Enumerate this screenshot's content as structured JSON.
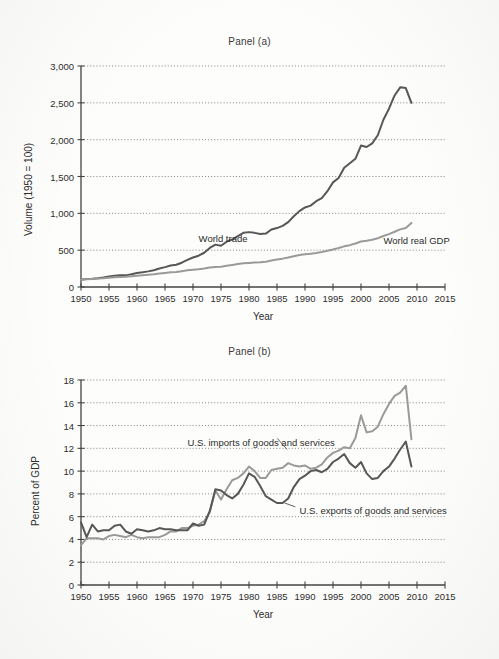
{
  "figure": {
    "background_color": "#fdfdfb",
    "dark_line_color": "#575757",
    "light_line_color": "#9a9a9a",
    "axis_color": "#444444",
    "grid_color": "#777777"
  },
  "chart_data": [
    {
      "type": "line",
      "title": "Panel (a)",
      "xlabel": "Year",
      "ylabel": "Volume (1950 = 100)",
      "xlim": [
        1950,
        2015
      ],
      "ylim": [
        0,
        3000
      ],
      "xticks": [
        1950,
        1955,
        1960,
        1965,
        1970,
        1975,
        1980,
        1985,
        1990,
        1995,
        2000,
        2005,
        2010,
        2015
      ],
      "xticklabels": [
        "1950",
        "1955",
        "1960",
        "1965",
        "1970",
        "1975",
        "1980",
        "1985",
        "1990",
        "1995",
        "2000",
        "2005",
        "2010",
        "2015"
      ],
      "yticks": [
        0,
        500,
        1000,
        1500,
        2000,
        2500,
        3000
      ],
      "yticklabels": [
        "0",
        "500",
        "1,000",
        "1,500",
        "2,000",
        "2,500",
        "3,000"
      ],
      "grid": "horizontal-dotted",
      "legend": "inline-annotations",
      "series": [
        {
          "name": "World trade",
          "color": "#575757",
          "label_x": 1971,
          "label_y": 660,
          "x": [
            1950,
            1951,
            1952,
            1953,
            1954,
            1955,
            1956,
            1957,
            1958,
            1959,
            1960,
            1961,
            1962,
            1963,
            1964,
            1965,
            1966,
            1967,
            1968,
            1969,
            1970,
            1971,
            1972,
            1973,
            1974,
            1975,
            1976,
            1977,
            1978,
            1979,
            1980,
            1981,
            1982,
            1983,
            1984,
            1985,
            1986,
            1987,
            1988,
            1989,
            1990,
            1991,
            1992,
            1993,
            1994,
            1995,
            1996,
            1997,
            1998,
            1999,
            2000,
            2001,
            2002,
            2003,
            2004,
            2005,
            2006,
            2007,
            2008,
            2009
          ],
          "y": [
            100,
            110,
            112,
            118,
            128,
            142,
            152,
            160,
            158,
            172,
            190,
            200,
            212,
            228,
            252,
            270,
            292,
            302,
            330,
            368,
            400,
            425,
            465,
            530,
            575,
            560,
            615,
            645,
            690,
            735,
            745,
            735,
            720,
            725,
            780,
            800,
            830,
            880,
            960,
            1030,
            1080,
            1105,
            1165,
            1205,
            1300,
            1420,
            1480,
            1620,
            1680,
            1740,
            1920,
            1900,
            1950,
            2060,
            2270,
            2420,
            2600,
            2710,
            2700,
            2500
          ]
        },
        {
          "name": "World real GDP",
          "color": "#9a9a9a",
          "label_x": 2004,
          "label_y": 640,
          "x": [
            1950,
            1951,
            1952,
            1953,
            1954,
            1955,
            1956,
            1957,
            1958,
            1959,
            1960,
            1961,
            1962,
            1963,
            1964,
            1965,
            1966,
            1967,
            1968,
            1969,
            1970,
            1971,
            1972,
            1973,
            1974,
            1975,
            1976,
            1977,
            1978,
            1979,
            1980,
            1981,
            1982,
            1983,
            1984,
            1985,
            1986,
            1987,
            1988,
            1989,
            1990,
            1991,
            1992,
            1993,
            1994,
            1995,
            1996,
            1997,
            1998,
            1999,
            2000,
            2001,
            2002,
            2003,
            2004,
            2005,
            2006,
            2007,
            2008,
            2009
          ],
          "y": [
            100,
            106,
            110,
            115,
            119,
            126,
            131,
            136,
            139,
            146,
            153,
            159,
            166,
            173,
            182,
            191,
            199,
            205,
            215,
            226,
            234,
            241,
            251,
            265,
            272,
            276,
            289,
            300,
            312,
            322,
            327,
            332,
            335,
            344,
            360,
            372,
            385,
            400,
            418,
            434,
            446,
            452,
            462,
            474,
            492,
            510,
            530,
            552,
            568,
            590,
            618,
            628,
            642,
            662,
            692,
            718,
            750,
            782,
            800,
            870,
            830
          ]
        }
      ]
    },
    {
      "type": "line",
      "title": "Panel (b)",
      "xlabel": "Year",
      "ylabel": "Percent of GDP",
      "xlim": [
        1950,
        2015
      ],
      "ylim": [
        0,
        18
      ],
      "xticks": [
        1950,
        1955,
        1960,
        1965,
        1970,
        1975,
        1980,
        1985,
        1990,
        1995,
        2000,
        2005,
        2010,
        2015
      ],
      "xticklabels": [
        "1950",
        "1955",
        "1960",
        "1965",
        "1970",
        "1975",
        "1980",
        "1985",
        "1990",
        "1995",
        "2000",
        "2005",
        "2010",
        "2015"
      ],
      "yticks": [
        0,
        2,
        4,
        6,
        8,
        10,
        12,
        14,
        16,
        18
      ],
      "yticklabels": [
        "0",
        "2",
        "4",
        "6",
        "8",
        "10",
        "12",
        "14",
        "16",
        "18"
      ],
      "grid": "horizontal-dotted",
      "legend": "inline-annotations",
      "series": [
        {
          "name": "U.S. imports of goods and services",
          "color": "#9a9a9a",
          "label_x": 1969,
          "label_y": 12.6,
          "leader_to_x": 1985,
          "leader_to_y": 11.9,
          "x": [
            1950,
            1951,
            1952,
            1953,
            1954,
            1955,
            1956,
            1957,
            1958,
            1959,
            1960,
            1961,
            1962,
            1963,
            1964,
            1965,
            1966,
            1967,
            1968,
            1969,
            1970,
            1971,
            1972,
            1973,
            1974,
            1975,
            1976,
            1977,
            1978,
            1979,
            1980,
            1981,
            1982,
            1983,
            1984,
            1985,
            1986,
            1987,
            1988,
            1989,
            1990,
            1991,
            1992,
            1993,
            1994,
            1995,
            1996,
            1997,
            1998,
            1999,
            2000,
            2001,
            2002,
            2003,
            2004,
            2005,
            2006,
            2007,
            2008,
            2009
          ],
          "y": [
            3.5,
            4.1,
            4.1,
            4.1,
            4.0,
            4.3,
            4.4,
            4.3,
            4.2,
            4.4,
            4.2,
            4.1,
            4.2,
            4.2,
            4.2,
            4.4,
            4.7,
            4.7,
            5.0,
            5.0,
            5.2,
            5.3,
            5.6,
            6.4,
            8.3,
            7.5,
            8.4,
            9.2,
            9.4,
            9.8,
            10.4,
            10.0,
            9.4,
            9.4,
            10.1,
            10.2,
            10.3,
            10.7,
            10.5,
            10.4,
            10.5,
            10.2,
            10.3,
            10.6,
            11.2,
            11.6,
            11.8,
            12.1,
            12.0,
            12.9,
            14.9,
            13.4,
            13.5,
            13.9,
            15.0,
            15.9,
            16.6,
            16.9,
            17.5,
            12.8
          ]
        },
        {
          "name": "U.S. exports of goods and services",
          "color": "#575757",
          "label_x": 1989,
          "label_y": 6.6,
          "leader_to_x": 1986,
          "leader_to_y": 7.2,
          "x": [
            1950,
            1951,
            1952,
            1953,
            1954,
            1955,
            1956,
            1957,
            1958,
            1959,
            1960,
            1961,
            1962,
            1963,
            1964,
            1965,
            1966,
            1967,
            1968,
            1969,
            1970,
            1971,
            1972,
            1973,
            1974,
            1975,
            1976,
            1977,
            1978,
            1979,
            1980,
            1981,
            1982,
            1983,
            1984,
            1985,
            1986,
            1987,
            1988,
            1989,
            1990,
            1991,
            1992,
            1993,
            1994,
            1995,
            1996,
            1997,
            1998,
            1999,
            2000,
            2001,
            2002,
            2003,
            2004,
            2005,
            2006,
            2007,
            2008,
            2009
          ],
          "y": [
            5.5,
            4.2,
            5.3,
            4.7,
            4.8,
            4.8,
            5.2,
            5.3,
            4.7,
            4.5,
            4.9,
            4.8,
            4.7,
            4.8,
            5.0,
            4.9,
            4.9,
            4.8,
            4.8,
            4.8,
            5.4,
            5.2,
            5.3,
            6.5,
            8.4,
            8.3,
            7.9,
            7.6,
            8.0,
            8.8,
            9.8,
            9.5,
            8.7,
            7.8,
            7.5,
            7.2,
            7.2,
            7.6,
            8.6,
            9.3,
            9.6,
            10.0,
            10.1,
            9.9,
            10.2,
            10.8,
            11.1,
            11.5,
            10.7,
            10.3,
            10.8,
            9.8,
            9.3,
            9.4,
            10.0,
            10.4,
            11.1,
            11.9,
            12.6,
            10.4
          ]
        }
      ]
    }
  ]
}
